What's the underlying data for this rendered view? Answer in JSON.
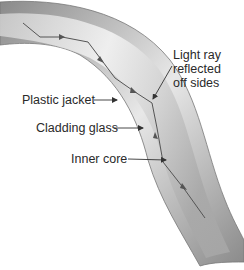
{
  "diagram": {
    "labels": {
      "light_ray_line1": "Light ray",
      "light_ray_line2": "reflected",
      "light_ray_line3": "off sides",
      "plastic_jacket": "Plastic jacket",
      "cladding_glass": "Cladding glass",
      "inner_core": "Inner core"
    },
    "colors": {
      "background": "#ffffff",
      "tube_dark": "#7a7a7a",
      "tube_mid": "#bdbdbd",
      "tube_light": "#f4f4f4",
      "ray": "#555555",
      "leader": "#333333",
      "text": "#2a2a2a"
    }
  }
}
